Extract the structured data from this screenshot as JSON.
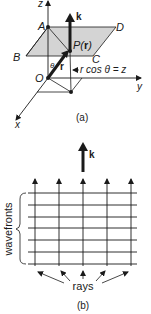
{
  "figure_a": {
    "caption": "(a)",
    "axes": {
      "z": "z",
      "y": "y",
      "x": "x"
    },
    "points": {
      "A": "A",
      "B": "B",
      "C": "C",
      "D": "D",
      "O": "O",
      "P": "P(",
      "P_r": "r",
      "P_close": ")"
    },
    "vector_k": "k",
    "vector_r": "r",
    "angle": "θ",
    "relation": "r cos θ = z"
  },
  "figure_b": {
    "caption": "(b)",
    "vector_k": "k",
    "wavefronts_label": "wavefronts",
    "rays_label": "rays",
    "ray_count": 5,
    "wavefront_count": 7
  },
  "colors": {
    "ink": "#1a1a1a",
    "plane_fill": "#d4d4d4"
  }
}
